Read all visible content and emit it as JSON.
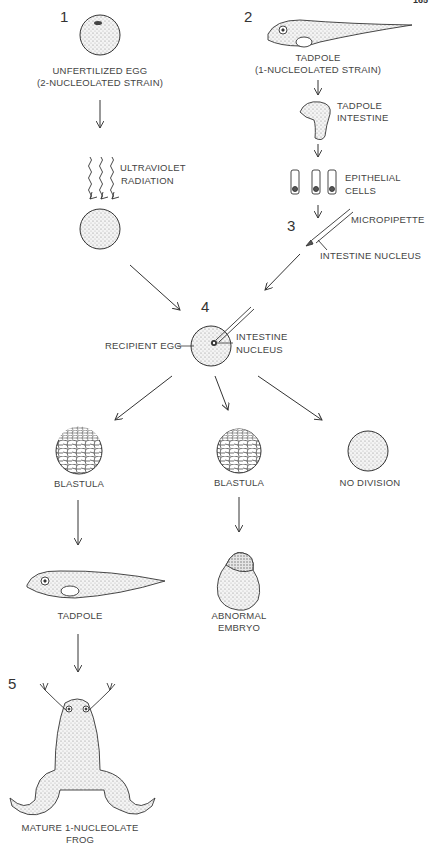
{
  "page": {
    "number": "165"
  },
  "steps": {
    "s1": "1",
    "s2": "2",
    "s3": "3",
    "s4": "4",
    "s5": "5"
  },
  "labels": {
    "unfertilized_egg_1": "UNFERTILIZED EGG",
    "unfertilized_egg_2": "(2-NUCLEOLATED STRAIN)",
    "uv_1": "ULTRAVIOLET",
    "uv_2": "RADIATION",
    "tadpole_top_1": "TADPOLE",
    "tadpole_top_2": "(1-NUCLEOLATED STRAIN)",
    "intestine_1": "TADPOLE",
    "intestine_2": "INTESTINE",
    "epithelial_1": "EPITHELIAL",
    "epithelial_2": "CELLS",
    "micropipette": "MICROPIPETTE",
    "intestine_nucleus_top": "INTESTINE NUCLEUS",
    "recipient_egg": "RECIPIENT EGG",
    "intestine_nucleus_1": "INTESTINE",
    "intestine_nucleus_2": "NUCLEUS",
    "blastula_left": "BLASTULA",
    "blastula_mid": "BLASTULA",
    "no_division": "NO DIVISION",
    "tadpole_bottom": "TADPOLE",
    "abnormal_1": "ABNORMAL",
    "abnormal_2": "EMBRYO",
    "frog_1": "MATURE 1-NUCLEOLATE",
    "frog_2": "FROG"
  },
  "colors": {
    "ink": "#333333",
    "stipple": "#bdbdbd",
    "text": "#444444"
  }
}
